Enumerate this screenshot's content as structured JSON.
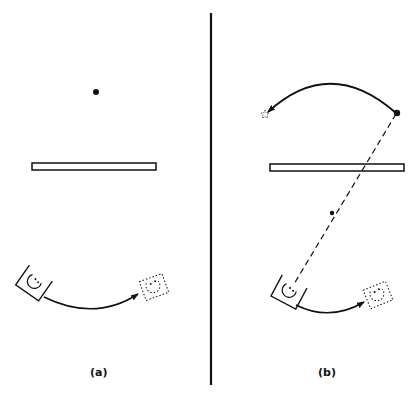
{
  "figure": {
    "panels": [
      {
        "id": "a",
        "label": "(a)",
        "elements": {
          "point_source": "filled dot above mirror",
          "mirror": "horizontal bar (plane mirror)",
          "object": "solid rotated square with face/circle",
          "object_image": "dotted rotated square (moved position)",
          "motion_arrow": "curved arrow from object to dotted copy"
        }
      },
      {
        "id": "b",
        "label": "(b)",
        "elements": {
          "point_source": "filled dot at upper right",
          "virtual_image": "small dotted star at upper left",
          "motion_arrow_top": "curved arrow from dot to dotted star",
          "mirror": "horizontal bar (plane mirror)",
          "sight_line": "dashed line from object through mirror to dot, with midpoint dot",
          "object": "solid rotated square with face/circle",
          "object_image": "dotted rotated square (moved position)",
          "motion_arrow_bottom": "curved arrow from object to dotted copy"
        }
      }
    ],
    "divider": "vertical line separating panels",
    "colors": {
      "ink": "#111111",
      "background": "#ffffff"
    }
  }
}
